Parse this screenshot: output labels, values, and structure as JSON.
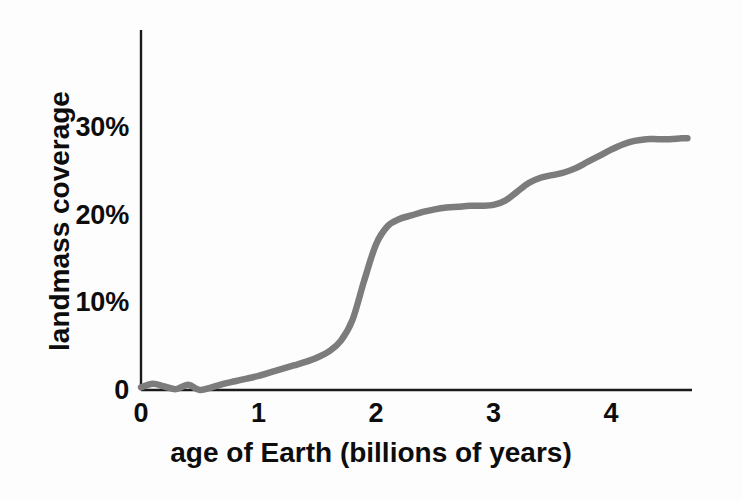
{
  "chart_data": {
    "type": "line",
    "title": "",
    "xlabel": "age of Earth (billions of years)",
    "ylabel": "landmass coverage",
    "x_ticks": [
      "0",
      "1",
      "2",
      "3",
      "4"
    ],
    "x_tick_values": [
      0,
      1,
      2,
      3,
      4
    ],
    "y_ticks": [
      "0",
      "10%",
      "20%",
      "30%"
    ],
    "y_tick_values": [
      0,
      10,
      20,
      30
    ],
    "xlim": [
      0,
      4.65
    ],
    "ylim": [
      0,
      34
    ],
    "grid": false,
    "legend": "none",
    "line_color": "#7c7c7c",
    "axis_color": "#1a1a1a",
    "series": [
      {
        "name": "landmass coverage",
        "x": [
          0.0,
          0.1,
          0.2,
          0.3,
          0.4,
          0.5,
          0.6,
          0.7,
          0.8,
          0.9,
          1.0,
          1.1,
          1.2,
          1.3,
          1.4,
          1.5,
          1.6,
          1.7,
          1.8,
          1.9,
          2.0,
          2.1,
          2.2,
          2.3,
          2.4,
          2.5,
          2.6,
          2.7,
          2.8,
          2.9,
          3.0,
          3.1,
          3.2,
          3.3,
          3.4,
          3.5,
          3.6,
          3.7,
          3.8,
          3.9,
          4.0,
          4.1,
          4.2,
          4.3,
          4.4,
          4.5,
          4.6,
          4.65
        ],
        "y": [
          0.3,
          0.7,
          0.4,
          0.1,
          0.6,
          0.0,
          0.3,
          0.7,
          1.0,
          1.3,
          1.6,
          2.0,
          2.4,
          2.8,
          3.2,
          3.7,
          4.4,
          5.6,
          8.0,
          12.5,
          16.6,
          18.7,
          19.5,
          19.9,
          20.3,
          20.6,
          20.8,
          20.9,
          21.0,
          21.0,
          21.1,
          21.6,
          22.6,
          23.6,
          24.2,
          24.5,
          24.8,
          25.3,
          26.0,
          26.7,
          27.4,
          28.0,
          28.4,
          28.6,
          28.6,
          28.6,
          28.7,
          28.7
        ]
      }
    ]
  },
  "axes": {
    "y_axis_name": "y-axis-line",
    "x_axis_name": "x-axis-line"
  }
}
